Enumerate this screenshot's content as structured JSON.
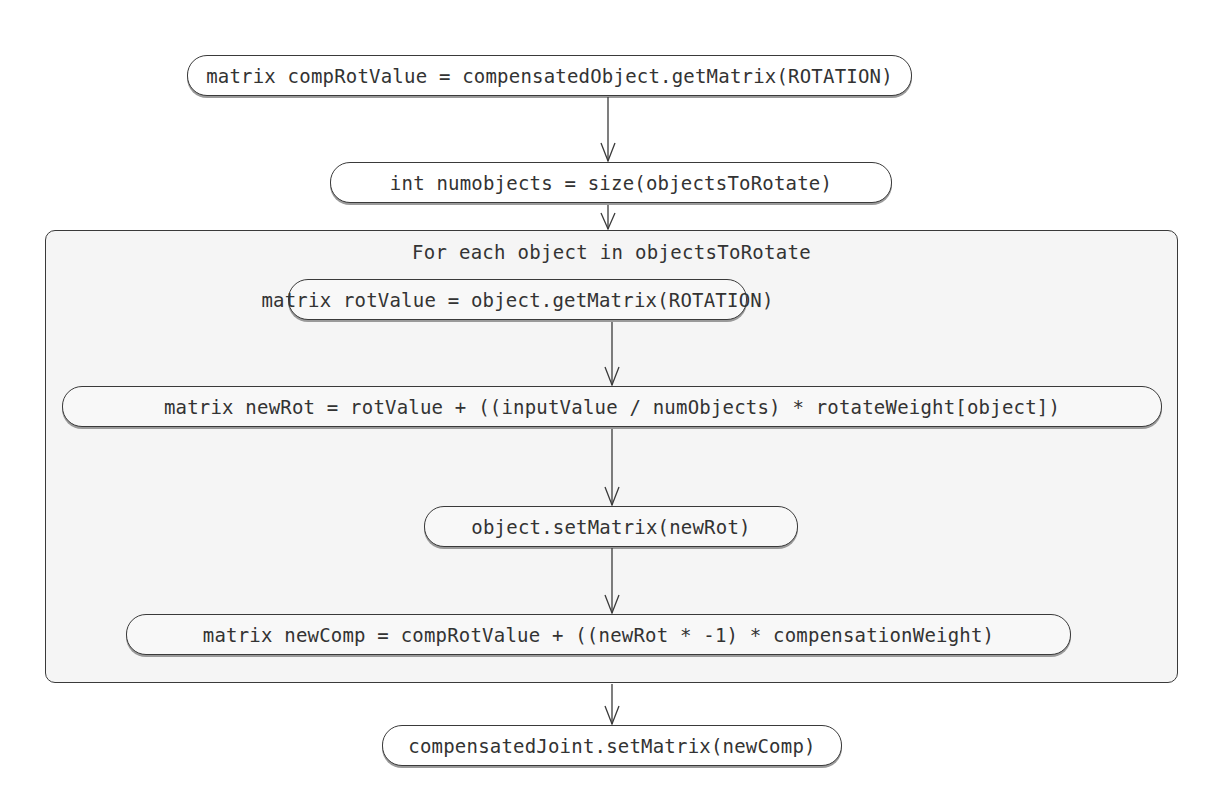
{
  "diagram": {
    "type": "flowchart",
    "nodes": [
      {
        "id": "n1",
        "label": "matrix compRotValue = compensatedObject.getMatrix(ROTATION)"
      },
      {
        "id": "n2",
        "label": "int numobjects = size(objectsToRotate)"
      },
      {
        "id": "n3",
        "label": "matrix rotValue = object.getMatrix(ROTATION)"
      },
      {
        "id": "n4",
        "label": "matrix newRot = rotValue + ((inputValue / numObjects) * rotateWeight[object])"
      },
      {
        "id": "n5",
        "label": "object.setMatrix(newRot)"
      },
      {
        "id": "n6",
        "label": "matrix newComp = compRotValue + ((newRot * -1) * compensationWeight)"
      },
      {
        "id": "n7",
        "label": "compensatedJoint.setMatrix(newComp)"
      }
    ],
    "loop": {
      "label": "For each object in objectsToRotate",
      "contains": [
        "n3",
        "n4",
        "n5",
        "n6"
      ]
    },
    "edges": [
      {
        "from": "n1",
        "to": "n2"
      },
      {
        "from": "n2",
        "to": "loop"
      },
      {
        "from": "n3",
        "to": "n4"
      },
      {
        "from": "n4",
        "to": "n5"
      },
      {
        "from": "n5",
        "to": "n6"
      },
      {
        "from": "loop",
        "to": "n7"
      }
    ],
    "colors": {
      "stroke": "#3a3a3a",
      "loop_fill": "#f5f5f5",
      "node_fill": "#ffffff",
      "text": "#333333"
    }
  }
}
